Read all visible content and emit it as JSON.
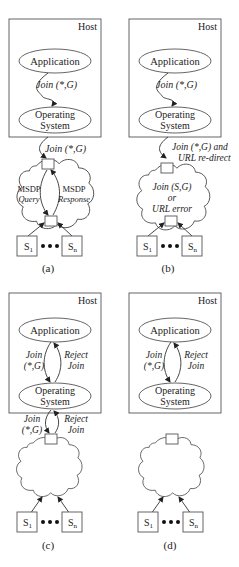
{
  "figure": {
    "panels": [
      {
        "id": "a",
        "caption": "(a)",
        "host_label": "Host",
        "app_label": "Application",
        "os_label_1": "Operating",
        "os_label_2": "System",
        "inner_msg": "Join (*,G)",
        "outer_msg": "Join (*,G)",
        "cloud_left": [
          "MSDP",
          "Query"
        ],
        "cloud_right": [
          "MSDP",
          "Response"
        ],
        "source_first": "S",
        "source_first_sub": "1",
        "source_last": "S",
        "source_last_sub": "n"
      },
      {
        "id": "b",
        "caption": "(b)",
        "host_label": "Host",
        "app_label": "Application",
        "os_label_1": "Operating",
        "os_label_2": "System",
        "inner_msg": "Join (*,G)",
        "outer_msg_1": "Join (*,G) and",
        "outer_msg_2": "URL re-direct",
        "cloud_text": [
          "Join (S,G)",
          "or",
          "URL error"
        ],
        "source_first": "S",
        "source_first_sub": "1",
        "source_last": "S",
        "source_last_sub": "n"
      },
      {
        "id": "c",
        "caption": "(c)",
        "host_label": "Host",
        "app_label": "Application",
        "os_label_1": "Operating",
        "os_label_2": "System",
        "inner_left": [
          "Join",
          "(*,G)"
        ],
        "inner_right": [
          "Reject",
          "Join"
        ],
        "outer_left": [
          "Join",
          "(*,G)"
        ],
        "outer_right": [
          "Reject",
          "Join"
        ],
        "source_first": "S",
        "source_first_sub": "1",
        "source_last": "S",
        "source_last_sub": "n"
      },
      {
        "id": "d",
        "caption": "(d)",
        "host_label": "Host",
        "app_label": "Application",
        "os_label_1": "Operating",
        "os_label_2": "System",
        "inner_left": [
          "Join",
          "(*,G)"
        ],
        "inner_right": [
          "Reject",
          "Join"
        ],
        "source_first": "S",
        "source_first_sub": "1",
        "source_last": "S",
        "source_last_sub": "n"
      }
    ]
  }
}
